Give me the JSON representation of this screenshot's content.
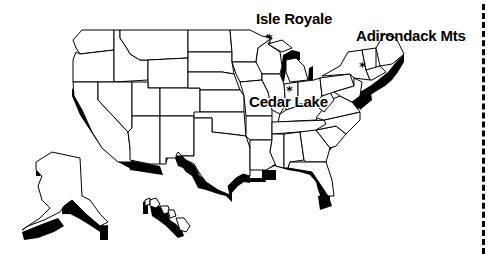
{
  "map": {
    "title": "",
    "region": "United States",
    "style": "extruded-outline",
    "colors": {
      "land": "#ffffff",
      "outline": "#000000",
      "extrusion": "#000000",
      "background": "#ffffff"
    },
    "sites": [
      {
        "name": "Isle Royale",
        "marker": "*",
        "label_x": 256,
        "label_y": 11,
        "marker_x": 267,
        "marker_y": 34
      },
      {
        "name": "Adirondack Mts",
        "marker": "*",
        "label_x": 356,
        "label_y": 28,
        "marker_x": 361,
        "marker_y": 61
      },
      {
        "name": "Cedar Lake",
        "marker": "*",
        "label_x": 249,
        "label_y": 94,
        "marker_x": 287,
        "marker_y": 86
      }
    ],
    "insets": [
      "Alaska",
      "Hawaii"
    ],
    "divider": {
      "style": "dashed",
      "x": 483
    }
  }
}
